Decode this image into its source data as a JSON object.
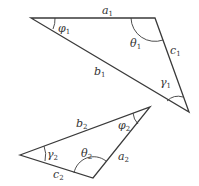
{
  "diagram": {
    "triangle1": {
      "sides": {
        "a": {
          "sym": "a",
          "sub": "1"
        },
        "b": {
          "sym": "b",
          "sub": "1"
        },
        "c": {
          "sym": "c",
          "sub": "1"
        }
      },
      "angles": {
        "phi": {
          "sym": "φ",
          "sub": "1"
        },
        "theta": {
          "sym": "θ",
          "sub": "1"
        },
        "gamma": {
          "sym": "γ",
          "sub": "1"
        }
      }
    },
    "triangle2": {
      "sides": {
        "a": {
          "sym": "a",
          "sub": "2"
        },
        "b": {
          "sym": "b",
          "sub": "2"
        },
        "c": {
          "sym": "c",
          "sub": "2"
        }
      },
      "angles": {
        "phi": {
          "sym": "φ",
          "sub": "2"
        },
        "theta": {
          "sym": "θ",
          "sub": "2"
        },
        "gamma": {
          "sym": "γ",
          "sub": "2"
        }
      }
    }
  }
}
